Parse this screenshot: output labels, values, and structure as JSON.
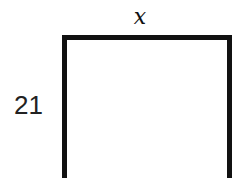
{
  "diagram": {
    "shape": "rectangle",
    "labels": {
      "top": "x",
      "left": "21"
    },
    "stroke_color": "#111111"
  }
}
